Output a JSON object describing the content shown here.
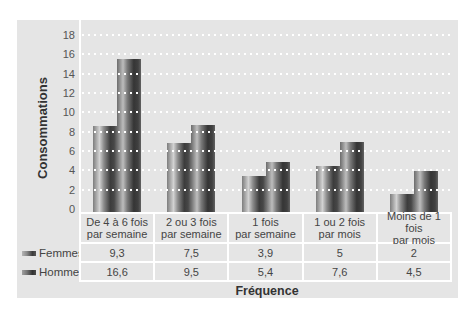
{
  "chart_data": {
    "type": "bar",
    "title": "",
    "xlabel": "Fréquence",
    "ylabel": "Consommations",
    "categories": [
      "De 4 à 6 fois par semaine",
      "2 ou 3 fois par semaine",
      "1 fois par semaine",
      "1 ou 2 fois par mois",
      "Moins de 1 fois par mois"
    ],
    "series": [
      {
        "name": "Femmes",
        "values": [
          9.3,
          7.5,
          3.9,
          5,
          2
        ]
      },
      {
        "name": "Hommes",
        "values": [
          16.6,
          9.5,
          5.4,
          7.6,
          4.5
        ]
      }
    ],
    "ylim": [
      0,
      18
    ],
    "yticks": [
      0,
      2,
      4,
      6,
      8,
      10,
      12,
      14,
      16,
      18
    ],
    "grid": true,
    "legend_position": "left of data table"
  },
  "axis": {
    "y_title": "Consommations",
    "x_title": "Fréquence"
  },
  "table": {
    "header": [
      "De 4 à 6 fois\npar semaine",
      "2 ou 3 fois\npar semaine",
      "1 fois\npar semaine",
      "1 ou 2 fois\npar mois",
      "Moins de 1 fois\npar mois"
    ],
    "rows": [
      {
        "label": "Femmes",
        "icon": "femmes-legend-swatch-icon",
        "cells": [
          "9,3",
          "7,5",
          "3,9",
          "5",
          "2"
        ]
      },
      {
        "label": "Hommes",
        "icon": "hommes-legend-swatch-icon",
        "cells": [
          "16,6",
          "9,5",
          "5,4",
          "7,6",
          "4,5"
        ]
      }
    ]
  },
  "colors": {
    "panel_background": "#e5e5e5",
    "gridline": "#ffffff",
    "bar_dark": "#3c3c3c",
    "bar_highlight": "#d2d2d2",
    "text": "#444444"
  }
}
